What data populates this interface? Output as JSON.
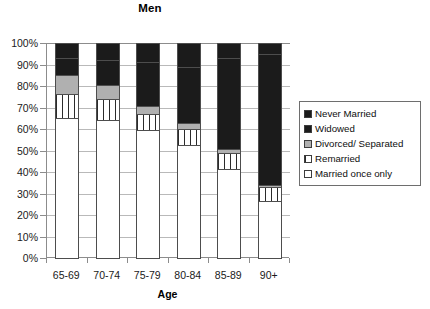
{
  "chart_data": {
    "type": "bar",
    "stacked": true,
    "stack_mode": "percent",
    "title": "Men",
    "xlabel": "Age",
    "ylabel": "",
    "categories": [
      "65-69",
      "70-74",
      "75-79",
      "80-84",
      "85-89",
      "90+"
    ],
    "ylim": [
      0,
      100
    ],
    "ytick_labels": [
      "0%",
      "10%",
      "20%",
      "30%",
      "40%",
      "50%",
      "60%",
      "70%",
      "80%",
      "90%",
      "100%"
    ],
    "ytick_values": [
      0,
      10,
      20,
      30,
      40,
      50,
      60,
      70,
      80,
      90,
      100
    ],
    "grid": true,
    "legend_position": "right",
    "series": [
      {
        "name": "Married  once only",
        "fill": "white",
        "values": [
          65.0,
          64.0,
          59.5,
          52.5,
          41.5,
          26.5
        ],
        "cumulative_tops": [
          65.0,
          64.0,
          59.5,
          52.5,
          41.5,
          26.5
        ]
      },
      {
        "name": "Remarried",
        "fill": "vertical-lines",
        "values": [
          11.5,
          10.0,
          7.5,
          7.5,
          7.5,
          6.5
        ],
        "cumulative_tops": [
          76.5,
          74.0,
          67.0,
          60.0,
          49.0,
          33.0
        ]
      },
      {
        "name": "Divorced/ Separated",
        "fill": "gray",
        "values": [
          8.5,
          6.5,
          3.5,
          3.0,
          1.5,
          1.0
        ],
        "cumulative_tops": [
          85.0,
          80.5,
          70.5,
          63.0,
          50.5,
          34.0
        ]
      },
      {
        "name": "Widowed",
        "fill": "dotted-dark",
        "values": [
          8.0,
          11.5,
          20.5,
          26.0,
          42.5,
          61.0
        ],
        "cumulative_tops": [
          93.0,
          92.0,
          91.0,
          89.0,
          93.0,
          95.0
        ]
      },
      {
        "name": "Never Married",
        "fill": "black",
        "values": [
          7.0,
          8.0,
          9.0,
          11.0,
          7.0,
          5.0
        ],
        "cumulative_tops": [
          100.0,
          100.0,
          100.0,
          100.0,
          100.0,
          100.0
        ]
      }
    ]
  },
  "legend": {
    "items": [
      {
        "label": "Never Married",
        "swatch": "black-swatch"
      },
      {
        "label": "Widowed",
        "swatch": "dotted-dark-swatch"
      },
      {
        "label": "Divorced/ Separated",
        "swatch": "gray-swatch"
      },
      {
        "label": "Remarried",
        "swatch": "vertical-lines-swatch"
      },
      {
        "label": "Married  once only",
        "swatch": "white-swatch"
      }
    ]
  },
  "colors": {
    "never_married": "#1b1b1b",
    "widowed": "#1b1b1b",
    "divorced_separated": "#b0b0b0",
    "remarried": "#ffffff",
    "married_once_only": "#ffffff",
    "axis": "#8c8c8c",
    "grid": "#b9b9b9",
    "text": "#0d0d0d"
  }
}
